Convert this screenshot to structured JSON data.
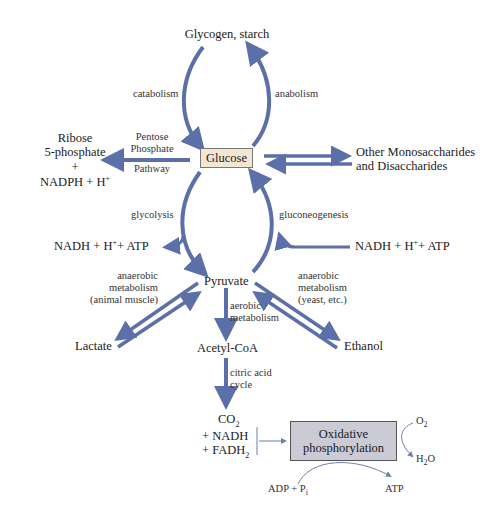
{
  "nodes": {
    "glycogen": "Glycogen, starch",
    "glucose": "Glucose",
    "ribose_line1": "Ribose",
    "ribose_line2": "5-phosphate",
    "ribose_line3": "+",
    "ribose_line4": "NADPH + H",
    "ribose_sup": "+",
    "other_line1": "Other Monosaccharides",
    "other_line2": "and Disaccharides",
    "nadh_left": "NADH + H",
    "nadh_left_tail": "+ ATP",
    "nadh_right": "NADH + H",
    "nadh_right_tail": "+ ATP",
    "plus_sup": "+",
    "pyruvate": "Pyruvate",
    "lactate": "Lactate",
    "acetyl": "Acetyl-CoA",
    "ethanol": "Ethanol",
    "co2": "CO",
    "co2_sub": "2",
    "plus_nadh": "+ NADH",
    "plus_fadh": "+ FADH",
    "fadh_sub": "2",
    "ox_line1": "Oxidative",
    "ox_line2": "phosphorylation",
    "o2": "O",
    "o2_sub": "2",
    "h2o_h": "H",
    "h2o_sub": "2",
    "h2o_o": "O",
    "adp": "ADP + P",
    "adp_sub": "i",
    "atp": "ATP"
  },
  "edges": {
    "catabolism": "catabolism",
    "anabolism": "anabolism",
    "pentose1": "Pentose",
    "pentose2": "Phosphate",
    "pentose3": "Pathway",
    "glycolysis": "glycolysis",
    "gluconeogenesis": "gluconeogenesis",
    "anaerobic_left1": "anaerobic",
    "anaerobic_left2": "metabolism",
    "anaerobic_left3": "(animal muscle)",
    "anaerobic_right1": "anaerobic",
    "anaerobic_right2": "metabolism",
    "anaerobic_right3": "(yeast, etc.)",
    "aerobic1": "aerobic",
    "aerobic2": "metabolism",
    "citric1": "citric acid",
    "citric2": "cycle"
  },
  "colors": {
    "arrow": "#5b6fa8",
    "glucose_box": "#f3e6d3",
    "oxidative_box": "#cbcbd6"
  }
}
